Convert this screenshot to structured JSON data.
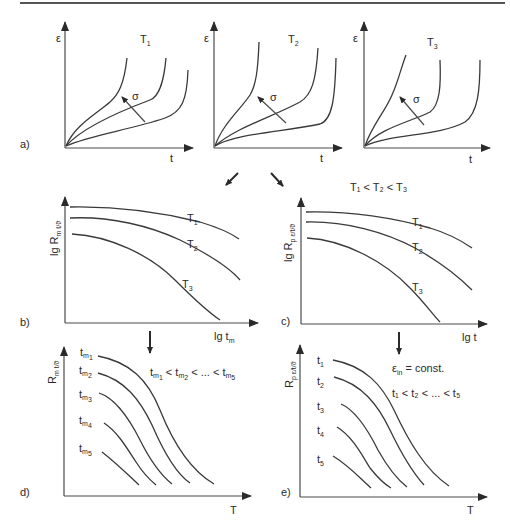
{
  "figure": {
    "top_rule": true,
    "relation_temps": "T₁ < T₂ < T₃",
    "panels": {
      "a": {
        "label": "a)",
        "subplots": [
          {
            "title": "T",
            "title_sub": "1",
            "ylabel": "ε",
            "xlabel": "t",
            "arrow_label": "σ"
          },
          {
            "title": "T",
            "title_sub": "2",
            "ylabel": "ε",
            "xlabel": "t",
            "arrow_label": "σ"
          },
          {
            "title": "T",
            "title_sub": "3",
            "ylabel": "ε",
            "xlabel": "t",
            "arrow_label": "σ"
          }
        ]
      },
      "b": {
        "label": "b)",
        "ylabel_main": "lg R",
        "ylabel_sub": "m t/ϑ",
        "xlabel_main": "lg t",
        "xlabel_sub": "m",
        "curves": [
          {
            "name": "T",
            "sub": "1"
          },
          {
            "name": "T",
            "sub": "2"
          },
          {
            "name": "T",
            "sub": "3"
          }
        ]
      },
      "c": {
        "label": "c)",
        "ylabel_main": "lg R",
        "ylabel_sub": "p ε/t/ϑ",
        "xlabel": "lg t",
        "curves": [
          {
            "name": "T",
            "sub": "1"
          },
          {
            "name": "T",
            "sub": "2"
          },
          {
            "name": "T",
            "sub": "3"
          }
        ]
      },
      "d": {
        "label": "d)",
        "ylabel_main": "R",
        "ylabel_sub": "m t/ϑ",
        "xlabel": "T",
        "relation": "t_m1 < t_m2 < ... < t_m5",
        "relation_parts": [
          "t",
          "m",
          "1",
          " < t",
          "m",
          "2",
          " < ... < t",
          "m",
          "5"
        ],
        "curves": [
          {
            "name": "t",
            "sub": "m",
            "subsub": "1"
          },
          {
            "name": "t",
            "sub": "m",
            "subsub": "2"
          },
          {
            "name": "t",
            "sub": "m",
            "subsub": "3"
          },
          {
            "name": "t",
            "sub": "m",
            "subsub": "4"
          },
          {
            "name": "t",
            "sub": "m",
            "subsub": "5"
          }
        ]
      },
      "e": {
        "label": "e)",
        "ylabel_main": "R",
        "ylabel_sub": "p ε/t/ϑ",
        "xlabel": "T",
        "condition_main": "ε",
        "condition_sub": "in",
        "condition_rest": " = const.",
        "relation": "t₁ < t₂ < ... < t₅",
        "curves": [
          {
            "name": "t",
            "sub": "1"
          },
          {
            "name": "t",
            "sub": "2"
          },
          {
            "name": "t",
            "sub": "3"
          },
          {
            "name": "t",
            "sub": "4"
          },
          {
            "name": "t",
            "sub": "5"
          }
        ]
      }
    },
    "flow_arrows": [
      "arrow-a-to-b",
      "arrow-a-to-c",
      "arrow-b-to-d",
      "arrow-c-to-e"
    ]
  }
}
